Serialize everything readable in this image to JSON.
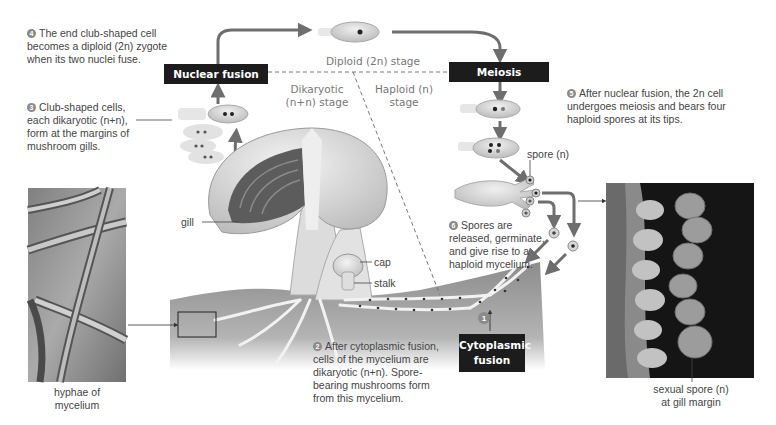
{
  "figure": {
    "stages": {
      "diploid": "Diploid (2n) stage",
      "dikaryotic": [
        "Dikaryotic",
        "(n+n) stage"
      ],
      "haploid": [
        "Haploid (n)",
        "stage"
      ]
    },
    "process_boxes": {
      "nuclear_fusion": "Nuclear fusion",
      "meiosis": "Meiosis",
      "cytoplasmic_fusion": [
        "Cytoplasmic",
        "fusion"
      ]
    },
    "steps": [
      {
        "number": "1",
        "text": ""
      },
      {
        "number": "2",
        "lines": [
          "After cytoplasmic fusion,",
          "cells of the mycelium are",
          "dikaryotic (n+n). Spore-",
          "bearing mushrooms form",
          "from this mycelium."
        ]
      },
      {
        "number": "3",
        "lines": [
          "Club-shaped cells,",
          "each dikaryotic (n+n),",
          "form at the margins of",
          "mushroom gills."
        ]
      },
      {
        "number": "4",
        "lines": [
          "The end club-shaped cell",
          "becomes a diploid (2n) zygote",
          "when its two nuclei fuse."
        ]
      },
      {
        "number": "5",
        "lines": [
          "After nuclear fusion, the 2n cell",
          "undergoes meiosis and bears four",
          "haploid spores at its tips."
        ]
      },
      {
        "number": "6",
        "lines": [
          "Spores are",
          "released, germinate,",
          "and give rise to a",
          "haploid mycelium."
        ]
      }
    ],
    "labels": {
      "gill": "gill",
      "cap": "cap",
      "stalk": "stalk",
      "spore": "spore (n)",
      "hyphae": [
        "hyphae of",
        "mycelium"
      ],
      "sexual_spore": [
        "sexual spore (n)",
        "at gill margin"
      ]
    },
    "colors": {
      "arrow": "#6e6e6e",
      "box": "#1c1c1c",
      "soil": "#9a9a9a",
      "cell": "#d6d6d6"
    }
  }
}
